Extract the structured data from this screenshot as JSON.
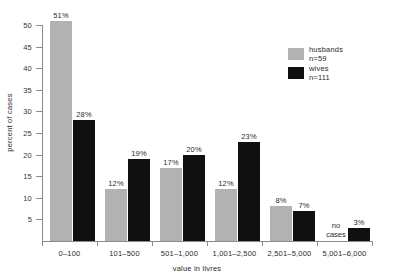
{
  "chart_data": {
    "type": "bar",
    "title": "",
    "xlabel": "value in livres",
    "ylabel": "percent of cases",
    "ylim": [
      0,
      50
    ],
    "yticks": [
      5,
      10,
      15,
      20,
      25,
      30,
      35,
      40,
      45,
      50
    ],
    "ytick_labels": [
      "5",
      "10",
      "15",
      "20",
      "25",
      "30",
      "35",
      "40",
      "45",
      "50"
    ],
    "grid": false,
    "legend_position": "upper right",
    "categories": [
      "0–100",
      "101–500",
      "501–1,000",
      "1,001–2,500",
      "2,501–5,000",
      "5,001–6,000"
    ],
    "series": [
      {
        "name": "husbands",
        "legend_label": "husbands",
        "legend_n": "n=59",
        "color": "#b2b2b2",
        "values": [
          51,
          12,
          17,
          12,
          8,
          null
        ],
        "value_labels": [
          "51%",
          "12%",
          "17%",
          "12%",
          "8%",
          "no cases"
        ]
      },
      {
        "name": "wives",
        "legend_label": "wives",
        "legend_n": "n=111",
        "color": "#101010",
        "values": [
          28,
          19,
          20,
          23,
          7,
          3
        ],
        "value_labels": [
          "28%",
          "19%",
          "20%",
          "23%",
          "7%",
          "3%"
        ]
      }
    ],
    "annotations": [
      {
        "text": "no cases",
        "category": "5,001–6,000",
        "series": "husbands"
      }
    ]
  }
}
